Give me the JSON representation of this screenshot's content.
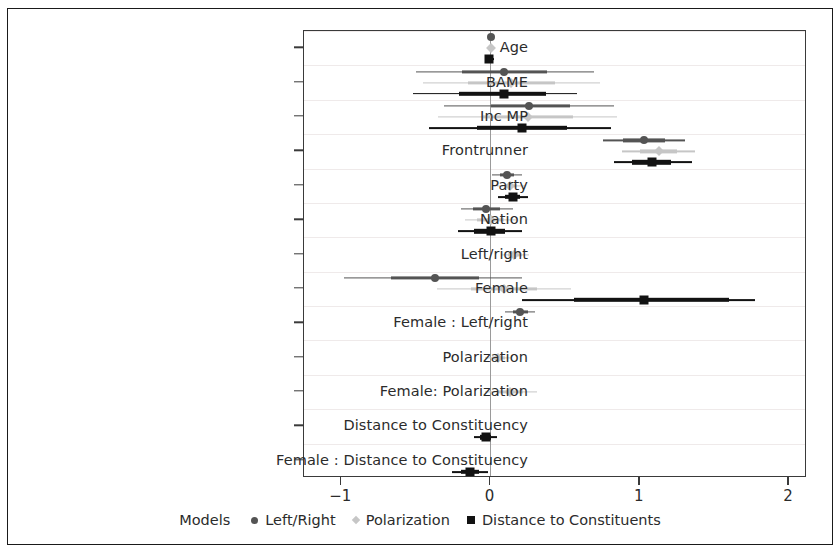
{
  "chart_data": {
    "type": "scatter",
    "title": "",
    "xlabel": "",
    "ylabel": "",
    "xlim": [
      -1.25,
      2.12
    ],
    "grid": true,
    "legend_position": "bottom",
    "legend_title": "Models",
    "x_ticks": [
      {
        "value": -1,
        "label": "−1"
      },
      {
        "value": 0,
        "label": "0"
      },
      {
        "value": 1,
        "label": "1"
      },
      {
        "value": 2,
        "label": "2"
      }
    ],
    "categories": [
      "Age",
      "BAME",
      "Inc MP",
      "Frontrunner",
      "Party",
      "Nation",
      "Left/right",
      "Female",
      "Female : Left/right",
      "Polarization",
      "Female: Polarization",
      "Distance to Constituency",
      "Female : Distance to Constituency"
    ],
    "series": [
      {
        "name": "Left/Right",
        "marker": "circle",
        "color": "#545454",
        "points": [
          {
            "category": "Age",
            "estimate": 0.0,
            "low": -0.02,
            "high": 0.02,
            "inner_low": -0.01,
            "inner_high": 0.01
          },
          {
            "category": "BAME",
            "estimate": 0.09,
            "low": -0.5,
            "high": 0.69,
            "inner_low": -0.19,
            "inner_high": 0.38
          },
          {
            "category": "Inc MP",
            "estimate": 0.26,
            "low": -0.31,
            "high": 0.83,
            "inner_low": 0.0,
            "inner_high": 0.53
          },
          {
            "category": "Frontrunner",
            "estimate": 1.03,
            "low": 0.75,
            "high": 1.3,
            "inner_low": 0.89,
            "inner_high": 1.17
          },
          {
            "category": "Party",
            "estimate": 0.11,
            "low": 0.01,
            "high": 0.21,
            "inner_low": 0.06,
            "inner_high": 0.16
          },
          {
            "category": "Nation",
            "estimate": -0.03,
            "low": -0.2,
            "high": 0.15,
            "inner_low": -0.12,
            "inner_high": 0.06
          },
          {
            "category": "Left/right",
            "estimate": null,
            "low": null,
            "high": null,
            "inner_low": null,
            "inner_high": null
          },
          {
            "category": "Female",
            "estimate": -0.37,
            "low": -0.98,
            "high": 0.21,
            "inner_low": -0.67,
            "inner_high": -0.08
          },
          {
            "category": "Female : Left/right",
            "estimate": 0.2,
            "low": 0.1,
            "high": 0.3,
            "inner_low": 0.15,
            "inner_high": 0.25
          },
          {
            "category": "Polarization",
            "estimate": null,
            "low": null,
            "high": null,
            "inner_low": null,
            "inner_high": null
          },
          {
            "category": "Female: Polarization",
            "estimate": null,
            "low": null,
            "high": null,
            "inner_low": null,
            "inner_high": null
          },
          {
            "category": "Distance to Constituency",
            "estimate": null,
            "low": null,
            "high": null,
            "inner_low": null,
            "inner_high": null
          },
          {
            "category": "Female : Distance to Constituency",
            "estimate": null,
            "low": null,
            "high": null,
            "inner_low": null,
            "inner_high": null
          }
        ]
      },
      {
        "name": "Polarization",
        "marker": "diamond",
        "color": "#c6c6c6",
        "points": [
          {
            "category": "Age",
            "estimate": 0.0,
            "low": -0.02,
            "high": 0.02,
            "inner_low": -0.01,
            "inner_high": 0.01
          },
          {
            "category": "BAME",
            "estimate": 0.14,
            "low": -0.45,
            "high": 0.73,
            "inner_low": -0.15,
            "inner_high": 0.43
          },
          {
            "category": "Inc MP",
            "estimate": 0.25,
            "low": -0.35,
            "high": 0.85,
            "inner_low": -0.05,
            "inner_high": 0.55
          },
          {
            "category": "Frontrunner",
            "estimate": 1.13,
            "low": 0.88,
            "high": 1.37,
            "inner_low": 1.0,
            "inner_high": 1.25
          },
          {
            "category": "Party",
            "estimate": 0.13,
            "low": 0.04,
            "high": 0.23,
            "inner_low": 0.09,
            "inner_high": 0.18
          },
          {
            "category": "Nation",
            "estimate": 0.0,
            "low": -0.17,
            "high": 0.18,
            "inner_low": -0.09,
            "inner_high": 0.09
          },
          {
            "category": "Left/right",
            "estimate": 0.16,
            "low": 0.07,
            "high": 0.26,
            "inner_low": 0.12,
            "inner_high": 0.21
          },
          {
            "category": "Female",
            "estimate": 0.09,
            "low": -0.36,
            "high": 0.54,
            "inner_low": -0.13,
            "inner_high": 0.31
          },
          {
            "category": "Female : Left/right",
            "estimate": null,
            "low": null,
            "high": null,
            "inner_low": null,
            "inner_high": null
          },
          {
            "category": "Polarization",
            "estimate": 0.05,
            "low": -0.04,
            "high": 0.14,
            "inner_low": 0.01,
            "inner_high": 0.1
          },
          {
            "category": "Female: Polarization",
            "estimate": 0.13,
            "low": -0.04,
            "high": 0.31,
            "inner_low": 0.04,
            "inner_high": 0.22
          },
          {
            "category": "Distance to Constituency",
            "estimate": null,
            "low": null,
            "high": null,
            "inner_low": null,
            "inner_high": null
          },
          {
            "category": "Female : Distance to Constituency",
            "estimate": null,
            "low": null,
            "high": null,
            "inner_low": null,
            "inner_high": null
          }
        ]
      },
      {
        "name": "Distance to Constituents",
        "marker": "square",
        "color": "#121212",
        "points": [
          {
            "category": "Age",
            "estimate": -0.01,
            "low": -0.03,
            "high": 0.02,
            "inner_low": -0.02,
            "inner_high": 0.01
          },
          {
            "category": "BAME",
            "estimate": 0.09,
            "low": -0.52,
            "high": 0.58,
            "inner_low": -0.21,
            "inner_high": 0.37
          },
          {
            "category": "Inc MP",
            "estimate": 0.21,
            "low": -0.41,
            "high": 0.81,
            "inner_low": -0.09,
            "inner_high": 0.51
          },
          {
            "category": "Frontrunner",
            "estimate": 1.08,
            "low": 0.83,
            "high": 1.35,
            "inner_low": 0.95,
            "inner_high": 1.21
          },
          {
            "category": "Party",
            "estimate": 0.15,
            "low": 0.05,
            "high": 0.25,
            "inner_low": 0.1,
            "inner_high": 0.2
          },
          {
            "category": "Nation",
            "estimate": 0.0,
            "low": -0.22,
            "high": 0.21,
            "inner_low": -0.11,
            "inner_high": 0.1
          },
          {
            "category": "Left/right",
            "estimate": null,
            "low": null,
            "high": null,
            "inner_low": null,
            "inner_high": null
          },
          {
            "category": "Female",
            "estimate": 1.03,
            "low": 0.21,
            "high": 1.77,
            "inner_low": 0.56,
            "inner_high": 1.6
          },
          {
            "category": "Female : Left/right",
            "estimate": null,
            "low": null,
            "high": null,
            "inner_low": null,
            "inner_high": null
          },
          {
            "category": "Polarization",
            "estimate": null,
            "low": null,
            "high": null,
            "inner_low": null,
            "inner_high": null
          },
          {
            "category": "Female: Polarization",
            "estimate": null,
            "low": null,
            "high": null,
            "inner_low": null,
            "inner_high": null
          },
          {
            "category": "Distance to Constituency",
            "estimate": -0.03,
            "low": -0.11,
            "high": 0.04,
            "inner_low": -0.07,
            "inner_high": 0.0
          },
          {
            "category": "Female : Distance to Constituency",
            "estimate": -0.14,
            "low": -0.26,
            "high": -0.02,
            "inner_low": -0.2,
            "inner_high": -0.08
          }
        ]
      }
    ]
  },
  "legend": {
    "title": "Models",
    "items": [
      {
        "label": "Left/Right",
        "marker": "circle",
        "color": "#545454"
      },
      {
        "label": "Polarization",
        "marker": "diamond",
        "color": "#c6c6c6"
      },
      {
        "label": "Distance to Constituents",
        "marker": "square",
        "color": "#121212"
      }
    ]
  }
}
